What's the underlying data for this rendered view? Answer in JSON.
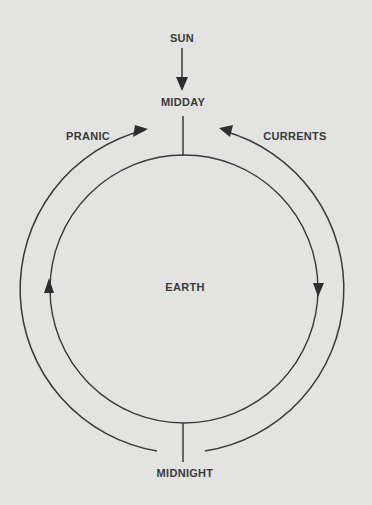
{
  "diagram": {
    "labels": {
      "sun": "SUN",
      "midday": "MIDDAY",
      "pranic": "PRANIC",
      "currents": "CURRENTS",
      "earth": "EARTH",
      "midnight": "MIDNIGHT"
    },
    "colors": {
      "background": "#e3e3e1",
      "stroke": "#3a3a3a",
      "text": "#3a3a3a"
    },
    "elements": {
      "earth_circle": {
        "cx": 184,
        "cy": 289,
        "r": 134
      },
      "current_arcs": {
        "cx": 184,
        "cy": 290,
        "r": 164
      },
      "sun_arrow_direction": "down",
      "left_arc_direction": "up (counter-clockwise toward midday)",
      "right_arc_direction": "down (clockwise from midday)"
    }
  }
}
